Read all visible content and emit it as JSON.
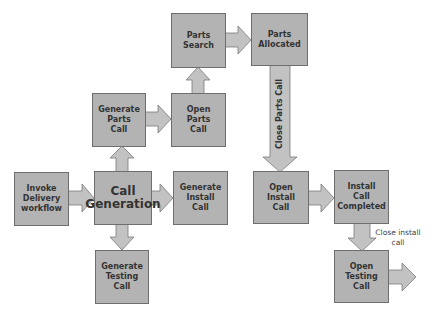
{
  "diagram": {
    "type": "flowchart",
    "colors": {
      "box_fill": "#b3b3b3",
      "box_border": "#6e6e6e",
      "arrow_fill": "#c2c2c2",
      "text": "#333333"
    },
    "nodes": {
      "parts_search": "Parts\nSearch",
      "parts_allocated": "Parts\nAllocated",
      "generate_parts_call": "Generate\nParts\nCall",
      "open_parts_call": "Open\nParts\nCall",
      "invoke_delivery": "Invoke\nDelivery\nworkflow",
      "call_generation": "Call\nGeneration",
      "generate_install_call": "Generate\nInstall\nCall",
      "generate_testing_call": "Generate\nTesting\nCall",
      "open_install_call": "Open\nInstall\nCall",
      "install_call_completed": "Install\nCall\nCompleted",
      "open_testing_call": "Open\nTesting\nCall"
    },
    "edge_labels": {
      "close_parts_call": "Close Parts Call",
      "close_install_call": "Close install\ncall"
    },
    "edges": [
      {
        "from": "Invoke Delivery workflow",
        "to": "Call Generation"
      },
      {
        "from": "Call Generation",
        "to": "Generate Parts Call"
      },
      {
        "from": "Call Generation",
        "to": "Generate Install Call"
      },
      {
        "from": "Call Generation",
        "to": "Generate Testing Call"
      },
      {
        "from": "Generate Parts Call",
        "to": "Open Parts Call"
      },
      {
        "from": "Open Parts Call",
        "to": "Parts Search"
      },
      {
        "from": "Parts Search",
        "to": "Parts Allocated"
      },
      {
        "from": "Parts Allocated",
        "to": "Open Install Call",
        "label": "Close Parts Call"
      },
      {
        "from": "Open Install Call",
        "to": "Install Call Completed"
      },
      {
        "from": "Install Call Completed",
        "to": "Open Testing Call",
        "label": "Close install call"
      },
      {
        "from": "Open Testing Call",
        "to": "(exit)"
      }
    ]
  }
}
